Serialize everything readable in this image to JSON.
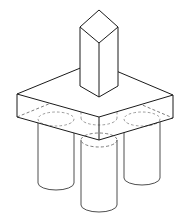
{
  "drawing": {
    "title": "Isometric assembly: square post on slab with four cylindrical legs",
    "view": "isometric",
    "line_style": {
      "visible_edge_color": "#1a1a1a",
      "hidden_edge_color": "#6e6e6e",
      "hidden_edge_dash": "dashed",
      "face_fill_color": "#ffffff",
      "background_color": "#ffffff",
      "visible_stroke_width": 1,
      "hidden_stroke_width": 0.9
    },
    "parts": [
      {
        "id": "post",
        "name": "vertical-rectangular-post",
        "shape": "rectangular prism",
        "visible": true,
        "top_face": {
          "left": [
            80,
            27
          ],
          "top": [
            99,
            10
          ],
          "right": [
            118,
            27
          ],
          "bottom": [
            99,
            43
          ]
        },
        "bottom_front": [
          99,
          97
        ],
        "left_bottom": [
          80,
          86
        ],
        "right_bottom": [
          118,
          86
        ],
        "height_px": 70
      },
      {
        "id": "slab",
        "name": "horizontal-rectangular-slab",
        "shape": "rectangular prism",
        "visible": true,
        "top_face": {
          "left": [
            17,
            94
          ],
          "back": [
            95,
            62
          ],
          "right": [
            173,
            95
          ],
          "front": [
            99,
            117
          ]
        },
        "thickness_px": 23,
        "bottom_face": {
          "left": [
            17,
            117
          ],
          "back": [
            95,
            85
          ],
          "right": [
            173,
            118
          ],
          "front": [
            99,
            140
          ]
        }
      },
      {
        "id": "leg-front",
        "name": "front-cylindrical-leg",
        "shape": "cylinder",
        "visible": true,
        "top_ellipse_center": [
          99,
          140
        ],
        "radius_x": 18,
        "radius_y": 7,
        "bottom_y": 212,
        "top_ellipse_hidden": true
      },
      {
        "id": "leg-left",
        "name": "left-cylindrical-leg",
        "shape": "cylinder",
        "visible": true,
        "top_ellipse_center": [
          56,
          119
        ],
        "radius_x": 18,
        "radius_y": 7,
        "bottom_y": 190,
        "top_ellipse_hidden": true
      },
      {
        "id": "leg-right",
        "name": "right-cylindrical-leg",
        "shape": "cylinder",
        "visible": true,
        "top_ellipse_center": [
          142,
          119
        ],
        "radius_x": 18,
        "radius_y": 7,
        "bottom_y": 185,
        "top_ellipse_hidden": true
      },
      {
        "id": "leg-back",
        "name": "back-hidden-cylindrical-leg",
        "shape": "cylinder",
        "visible": false,
        "top_ellipse_center": [
          99,
          107
        ],
        "bottom_ellipse_center": [
          99,
          118
        ],
        "radius_x": 18,
        "radius_y": 7,
        "fully_hidden": true
      }
    ],
    "counts": {
      "legs_total": 4,
      "legs_visible": 3,
      "legs_hidden": 1,
      "posts": 1,
      "slabs": 1
    }
  }
}
